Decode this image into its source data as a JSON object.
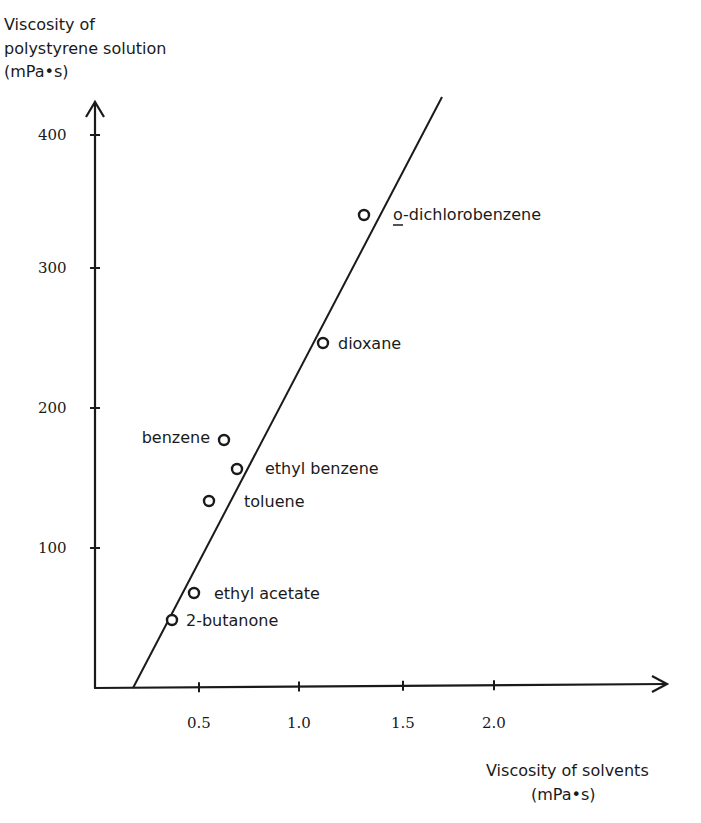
{
  "chart_data": {
    "type": "scatter",
    "title": "",
    "ylabel_lines": [
      "Viscosity of",
      "polystyrene solution",
      "(mPa•s)"
    ],
    "xlabel_lines": [
      "Viscosity of solvents",
      "(mPa•s)"
    ],
    "xlabel": "Viscosity of solvents (mPa•s)",
    "ylabel": "Viscosity of polystyrene solution (mPa•s)",
    "x_ticks": [
      "0.5",
      "1.0",
      "1.5",
      "2.0"
    ],
    "y_ticks": [
      "100",
      "200",
      "300",
      "400"
    ],
    "xlim": [
      0,
      2.85
    ],
    "ylim": [
      0,
      420
    ],
    "grid": false,
    "legend": "none",
    "points": [
      {
        "label": "2-butanone",
        "x": 0.37,
        "y": 49
      },
      {
        "label": "ethyl acetate",
        "x": 0.47,
        "y": 68
      },
      {
        "label": "toluene",
        "x": 0.55,
        "y": 134
      },
      {
        "label": "ethyl benzene",
        "x": 0.69,
        "y": 156
      },
      {
        "label": "benzene",
        "x": 0.63,
        "y": 177
      },
      {
        "label": "dioxane",
        "x": 1.12,
        "y": 246
      },
      {
        "label": "o-dichlorobenzene",
        "x": 1.33,
        "y": 338
      }
    ],
    "fit_line": {
      "x0": 0.17,
      "y0": 0,
      "x1": 1.72,
      "y1": 422
    }
  }
}
